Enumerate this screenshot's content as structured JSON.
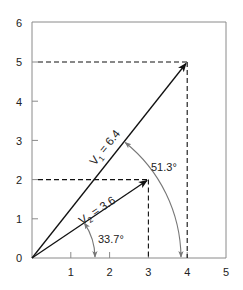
{
  "diagram": {
    "type": "vector diagram",
    "colors": {
      "frame": "#8a8a8a",
      "vector": "#111111",
      "dashed": "#111111",
      "arc": "#777777",
      "text": "#222222"
    },
    "axes": {
      "x_ticks": [
        "1",
        "2",
        "3",
        "4",
        "5"
      ],
      "y_ticks": [
        "0",
        "1",
        "2",
        "3",
        "4",
        "5",
        "6"
      ],
      "xlim": [
        0,
        5
      ],
      "ylim": [
        0,
        6
      ]
    },
    "vectors": [
      {
        "name": "V1",
        "label_main": "V",
        "label_sub": "1",
        "label_value": " = 6.4",
        "from": [
          0,
          0
        ],
        "to": [
          4,
          5
        ],
        "magnitude": 6.4
      },
      {
        "name": "V2",
        "label_main": "V",
        "label_sub": "2",
        "label_value": " = 3.6",
        "from": [
          0,
          0
        ],
        "to": [
          3,
          2
        ],
        "magnitude": 3.6
      }
    ],
    "angles": [
      {
        "label": "51.3°",
        "value_deg": 51.3,
        "vector": "V1"
      },
      {
        "label": "33.7°",
        "value_deg": 33.7,
        "vector": "V2"
      }
    ],
    "projections": [
      {
        "vector": "V1",
        "x": 4,
        "y": 5
      },
      {
        "vector": "V2",
        "x": 3,
        "y": 2
      }
    ]
  }
}
